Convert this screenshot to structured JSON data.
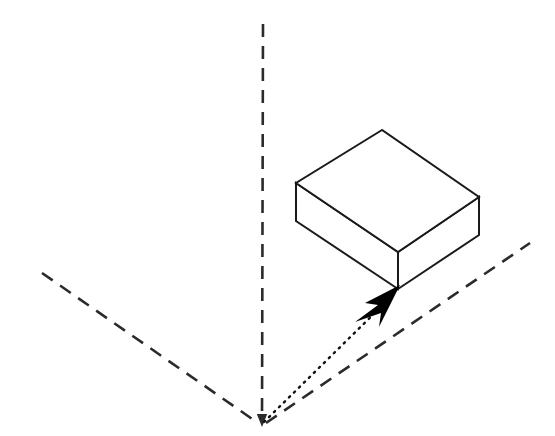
{
  "figure": {
    "canvas": {
      "width": 555,
      "height": 436
    },
    "background_color": "#ffffff",
    "stroke_color": "#1a1a1a",
    "fill_color": "#ffffff",
    "arrow_fill_color": "#000000"
  },
  "origin": {
    "x": 262,
    "y": 425,
    "label": "origin"
  },
  "axes": [
    {
      "name": "vertical-axis",
      "style": "dashed",
      "color": "#2b2b2b",
      "stroke_width": 2.6,
      "dash_pattern": "13 9",
      "from": {
        "x": 263,
        "y": 24
      },
      "to": {
        "x": 262,
        "y": 421
      },
      "has_arrowhead": true,
      "arrow_direction": "down"
    },
    {
      "name": "left-axis",
      "style": "dashed",
      "color": "#2b2b2b",
      "stroke_width": 2.6,
      "dash_pattern": "13 9",
      "from": {
        "x": 42,
        "y": 273
      },
      "to": {
        "x": 258,
        "y": 423
      },
      "has_arrowhead": false,
      "arrow_direction": "none"
    },
    {
      "name": "right-axis",
      "style": "dashed",
      "color": "#2b2b2b",
      "stroke_width": 2.6,
      "dash_pattern": "13 9",
      "from": {
        "x": 266,
        "y": 423
      },
      "to": {
        "x": 530,
        "y": 243
      },
      "has_arrowhead": false,
      "arrow_direction": "none"
    }
  ],
  "box": {
    "name": "cuboid",
    "stroke_color": "#1a1a1a",
    "stroke_width": 2.0,
    "fill_color": "#ffffff",
    "vertices": {
      "top_back": {
        "x": 382,
        "y": 130
      },
      "top_left": {
        "x": 296,
        "y": 183
      },
      "top_right": {
        "x": 479,
        "y": 197
      },
      "top_front": {
        "x": 398,
        "y": 252
      },
      "bottom_left": {
        "x": 296,
        "y": 221
      },
      "bottom_right": {
        "x": 479,
        "y": 235
      },
      "bottom_front": {
        "x": 398,
        "y": 289
      }
    },
    "faces": [
      {
        "name": "top-face",
        "points": "382,130 296,183 398,252 479,197"
      },
      {
        "name": "left-face",
        "points": "296,183 296,221 398,289 398,252"
      },
      {
        "name": "right-face",
        "points": "398,252 398,289 479,235 479,197"
      }
    ]
  },
  "vector": {
    "name": "position-vector",
    "style": "dotted",
    "color": "#111111",
    "stroke_width": 2.4,
    "dash_pattern": "1.5 5.5",
    "from": {
      "x": 264,
      "y": 422
    },
    "to": {
      "x": 392,
      "y": 296
    },
    "arrowhead": {
      "name": "vector-arrowhead",
      "fill": "#000000",
      "points": "400,285 365,303 378,305 355,322 381,313 379,327"
    }
  }
}
